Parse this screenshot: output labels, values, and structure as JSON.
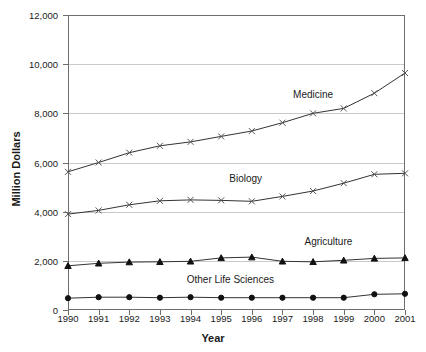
{
  "chart_data": {
    "type": "line",
    "title": "",
    "xlabel": "Year",
    "ylabel": "Million Dollars",
    "categories": [
      "1990",
      "1991",
      "1992",
      "1993",
      "1994",
      "1995",
      "1996",
      "1997",
      "1998",
      "1999",
      "2000",
      "2001"
    ],
    "x": [
      1990,
      1991,
      1992,
      1993,
      1994,
      1995,
      1996,
      1997,
      1998,
      1999,
      2000,
      2001
    ],
    "ylim": [
      0,
      12000
    ],
    "xlim": [
      1990,
      2001
    ],
    "ytick_labels": [
      "0",
      "2,000",
      "4,000",
      "6,000",
      "8,000",
      "10,000",
      "12,000"
    ],
    "yticks": [
      0,
      2000,
      4000,
      6000,
      8000,
      10000,
      12000
    ],
    "grid": "horizontal",
    "legend_position": "inline-annotations",
    "series": [
      {
        "name": "Medicine",
        "marker": "x",
        "values": [
          5620,
          6000,
          6400,
          6680,
          6840,
          7060,
          7280,
          7620,
          8000,
          8200,
          8820,
          9640
        ]
      },
      {
        "name": "Biology",
        "marker": "x",
        "values": [
          3900,
          4050,
          4280,
          4440,
          4480,
          4460,
          4420,
          4620,
          4840,
          5160,
          5520,
          5560
        ]
      },
      {
        "name": "Agriculture",
        "marker": "triangle",
        "values": [
          1800,
          1900,
          1950,
          1960,
          1980,
          2120,
          2150,
          1980,
          1960,
          2020,
          2100,
          2120
        ]
      },
      {
        "name": "Other Life Sciences",
        "marker": "circle",
        "values": [
          480,
          520,
          520,
          500,
          520,
          500,
          500,
          500,
          500,
          500,
          640,
          660
        ]
      }
    ],
    "annotations": [
      {
        "text": "Medicine",
        "x": 1998.0,
        "y": 8700
      },
      {
        "text": "Biology",
        "x": 1995.8,
        "y": 5300
      },
      {
        "text": "Agriculture",
        "x": 1998.5,
        "y": 2720
      },
      {
        "text": "Other Life Sciences",
        "x": 1995.3,
        "y": 1180
      }
    ],
    "colors": {
      "line": "#333333",
      "grid": "#c9c9c9",
      "axis": "#6e6e6e",
      "text": "#1a1a1a",
      "background": "#ffffff"
    }
  }
}
